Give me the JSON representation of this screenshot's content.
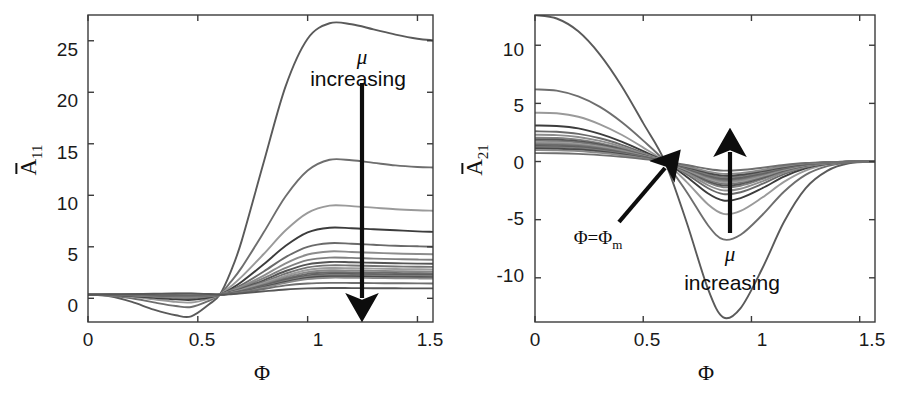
{
  "figure": {
    "background": "#ffffff",
    "axis_color": "#3b3b3b",
    "text_color": "#1a1a1a",
    "arrow_color": "#0d0d0d"
  },
  "panels": [
    {
      "id": "left",
      "ylabel_main": "A",
      "ylabel_sub": "11",
      "xlabel": "Φ",
      "xticks": [
        "0",
        "0.5",
        "1",
        "1.5"
      ],
      "yticks": [
        "0",
        "5",
        "10",
        "15",
        "20",
        "25"
      ],
      "annotations": {
        "mu": "μ",
        "increasing": "increasing"
      }
    },
    {
      "id": "right",
      "ylabel_main": "A",
      "ylabel_sub": "21",
      "xlabel": "Φ",
      "xticks": [
        "0",
        "0.5",
        "1",
        "1.5"
      ],
      "yticks": [
        "-10",
        "-5",
        "0",
        "5",
        "10"
      ],
      "annotations": {
        "mu": "μ",
        "increasing": "increasing",
        "phi_m_main": "Φ=Φ",
        "phi_m_sub": "m"
      }
    }
  ],
  "chart_data": [
    {
      "type": "line",
      "panel": "left",
      "title": "",
      "xlabel": "Φ",
      "ylabel": "Ā11 (A-bar 11)",
      "xlim": [
        0,
        1.5708
      ],
      "ylim": [
        -2.3,
        27.5
      ],
      "grid": false,
      "legend": "none",
      "x": [
        0,
        0.1,
        0.2,
        0.3,
        0.4,
        0.47,
        0.55,
        0.6,
        0.65,
        0.7,
        0.8,
        0.9,
        1.0,
        1.1,
        1.2,
        1.3,
        1.4,
        1.5,
        1.5708
      ],
      "crossing_point": {
        "x": 0.6,
        "y": 0.35
      },
      "series": [
        {
          "name": "mu-1 (smallest, darkest)",
          "gray": "#5a5a5a",
          "values": [
            0.35,
            0.2,
            -0.35,
            -1.1,
            -1.65,
            -1.75,
            -0.6,
            0.35,
            2.6,
            5.6,
            13.2,
            20.6,
            25.2,
            26.7,
            26.6,
            26.1,
            25.6,
            25.2,
            25.05
          ]
        },
        {
          "name": "mu-2",
          "gray": "#6e6e6e",
          "values": [
            0.35,
            0.25,
            0.0,
            -0.4,
            -0.75,
            -0.85,
            -0.25,
            0.35,
            1.6,
            3.0,
            6.4,
            9.9,
            12.4,
            13.45,
            13.4,
            13.15,
            12.9,
            12.75,
            12.7
          ]
        },
        {
          "name": "mu-3",
          "gray": "#9a9a9a",
          "values": [
            0.35,
            0.3,
            0.15,
            -0.1,
            -0.35,
            -0.4,
            -0.05,
            0.35,
            1.15,
            2.1,
            4.3,
            6.6,
            8.3,
            9.0,
            8.95,
            8.8,
            8.65,
            8.55,
            8.5
          ]
        },
        {
          "name": "mu-4",
          "gray": "#3c3c3c",
          "values": [
            0.35,
            0.32,
            0.22,
            0.05,
            -0.1,
            -0.15,
            0.08,
            0.35,
            0.9,
            1.6,
            3.3,
            5.1,
            6.4,
            6.85,
            6.8,
            6.7,
            6.6,
            6.5,
            6.45
          ]
        },
        {
          "name": "mu-5",
          "gray": "#6a6a6a",
          "values": [
            0.35,
            0.33,
            0.26,
            0.14,
            0.03,
            0.0,
            0.16,
            0.35,
            0.8,
            1.3,
            2.6,
            4.0,
            5.0,
            5.35,
            5.3,
            5.2,
            5.1,
            5.05,
            5.0
          ]
        },
        {
          "name": "mu-6",
          "gray": "#8d8d8d",
          "values": [
            0.35,
            0.34,
            0.29,
            0.2,
            0.11,
            0.09,
            0.21,
            0.35,
            0.72,
            1.15,
            2.2,
            3.4,
            4.25,
            4.55,
            4.5,
            4.42,
            4.35,
            4.3,
            4.28
          ]
        },
        {
          "name": "mu-7",
          "gray": "#808080",
          "values": [
            0.35,
            0.34,
            0.31,
            0.25,
            0.18,
            0.16,
            0.25,
            0.35,
            0.66,
            1.03,
            1.95,
            2.95,
            3.7,
            3.95,
            3.92,
            3.85,
            3.8,
            3.76,
            3.74
          ]
        },
        {
          "name": "mu-8",
          "gray": "#555555",
          "values": [
            0.35,
            0.35,
            0.32,
            0.28,
            0.23,
            0.22,
            0.28,
            0.35,
            0.62,
            0.94,
            1.75,
            2.65,
            3.3,
            3.53,
            3.5,
            3.45,
            3.4,
            3.37,
            3.35
          ]
        },
        {
          "name": "mu-9",
          "gray": "#747474",
          "values": [
            0.35,
            0.35,
            0.33,
            0.3,
            0.27,
            0.26,
            0.3,
            0.35,
            0.58,
            0.87,
            1.6,
            2.4,
            3.0,
            3.2,
            3.18,
            3.13,
            3.09,
            3.06,
            3.05
          ]
        },
        {
          "name": "mu-10",
          "gray": "#9c9c9c",
          "values": [
            0.35,
            0.35,
            0.34,
            0.32,
            0.3,
            0.29,
            0.32,
            0.35,
            0.55,
            0.81,
            1.48,
            2.2,
            2.75,
            2.94,
            2.92,
            2.88,
            2.84,
            2.82,
            2.8
          ]
        },
        {
          "name": "mu-11",
          "gray": "#888888",
          "values": [
            0.35,
            0.35,
            0.34,
            0.33,
            0.32,
            0.31,
            0.33,
            0.35,
            0.53,
            0.76,
            1.37,
            2.04,
            2.54,
            2.72,
            2.7,
            2.66,
            2.63,
            2.6,
            2.59
          ]
        },
        {
          "name": "mu-12",
          "gray": "#6b6b6b",
          "values": [
            0.35,
            0.35,
            0.35,
            0.34,
            0.33,
            0.33,
            0.34,
            0.35,
            0.51,
            0.72,
            1.28,
            1.9,
            2.37,
            2.53,
            2.51,
            2.48,
            2.45,
            2.43,
            2.42
          ]
        },
        {
          "name": "mu-13",
          "gray": "#5f5f5f",
          "values": [
            0.35,
            0.35,
            0.35,
            0.35,
            0.35,
            0.35,
            0.35,
            0.35,
            0.49,
            0.68,
            1.2,
            1.78,
            2.22,
            2.37,
            2.36,
            2.33,
            2.3,
            2.28,
            2.27
          ]
        },
        {
          "name": "mu-14",
          "gray": "#7c7c7c",
          "values": [
            0.35,
            0.35,
            0.35,
            0.36,
            0.36,
            0.36,
            0.36,
            0.35,
            0.48,
            0.65,
            1.14,
            1.68,
            2.09,
            2.24,
            2.23,
            2.2,
            2.17,
            2.15,
            2.14
          ]
        },
        {
          "name": "mu-15",
          "gray": "#4a4a4a",
          "values": [
            0.35,
            0.36,
            0.36,
            0.37,
            0.37,
            0.37,
            0.36,
            0.35,
            0.46,
            0.62,
            1.08,
            1.59,
            1.98,
            2.12,
            2.11,
            2.08,
            2.06,
            2.04,
            2.03
          ]
        },
        {
          "name": "mu-16",
          "gray": "#8a8a8a",
          "values": [
            0.35,
            0.36,
            0.37,
            0.38,
            0.39,
            0.39,
            0.37,
            0.35,
            0.45,
            0.59,
            1.02,
            1.5,
            1.87,
            2.0,
            1.99,
            1.97,
            1.95,
            1.93,
            1.92
          ]
        },
        {
          "name": "mu-17 (largest, light)",
          "gray": "#6f6f6f",
          "values": [
            0.35,
            0.37,
            0.39,
            0.42,
            0.44,
            0.45,
            0.4,
            0.35,
            0.42,
            0.54,
            0.9,
            1.25,
            1.44,
            1.5,
            1.49,
            1.47,
            1.46,
            1.45,
            1.44
          ]
        },
        {
          "name": "mu-18 (bottom band)",
          "gray": "#575757",
          "values": [
            0.35,
            0.37,
            0.4,
            0.44,
            0.47,
            0.48,
            0.42,
            0.35,
            0.4,
            0.48,
            0.68,
            0.86,
            0.96,
            1.0,
            0.99,
            0.98,
            0.97,
            0.96,
            0.96
          ]
        }
      ],
      "arrow": {
        "label": "μ increasing",
        "from": {
          "x": 1.245,
          "y": 22.8
        },
        "to": {
          "x": 1.245,
          "y": 1.1
        }
      }
    },
    {
      "type": "line",
      "panel": "right",
      "title": "",
      "xlabel": "Φ",
      "ylabel": "Ā21 (A-bar 21)",
      "xlim": [
        0,
        1.5708
      ],
      "ylim": [
        -13.8,
        12.6
      ],
      "grid": false,
      "legend": "none",
      "x": [
        0,
        0.1,
        0.2,
        0.3,
        0.4,
        0.5,
        0.6,
        0.7,
        0.8,
        0.87,
        0.95,
        1.05,
        1.15,
        1.25,
        1.35,
        1.45,
        1.5708
      ],
      "crossing_point": {
        "x": 0.6,
        "y": 0.0
      },
      "series": [
        {
          "name": "mu-1 (smallest, darkest)",
          "gray": "#5a5a5a",
          "values": [
            12.6,
            12.3,
            11.2,
            9.2,
            6.5,
            3.3,
            0.0,
            -5.2,
            -11.0,
            -13.4,
            -12.6,
            -9.2,
            -5.2,
            -2.3,
            -0.8,
            -0.15,
            0.0
          ]
        },
        {
          "name": "mu-2",
          "gray": "#6e6e6e",
          "values": [
            6.2,
            6.1,
            5.6,
            4.7,
            3.4,
            1.8,
            0.0,
            -2.6,
            -5.5,
            -6.7,
            -6.3,
            -4.6,
            -2.6,
            -1.15,
            -0.4,
            -0.08,
            0.0
          ]
        },
        {
          "name": "mu-3",
          "gray": "#9a9a9a",
          "values": [
            4.2,
            4.15,
            3.85,
            3.2,
            2.3,
            1.2,
            0.0,
            -1.75,
            -3.7,
            -4.5,
            -4.25,
            -3.1,
            -1.75,
            -0.78,
            -0.27,
            -0.05,
            0.0
          ]
        },
        {
          "name": "mu-4",
          "gray": "#3c3c3c",
          "values": [
            3.1,
            3.05,
            2.85,
            2.38,
            1.72,
            0.9,
            0.0,
            -1.3,
            -2.75,
            -3.35,
            -3.15,
            -2.3,
            -1.3,
            -0.58,
            -0.2,
            -0.04,
            0.0
          ]
        },
        {
          "name": "mu-5",
          "gray": "#6a6a6a",
          "values": [
            2.6,
            2.56,
            2.38,
            2.0,
            1.44,
            0.75,
            0.0,
            -1.08,
            -2.3,
            -2.8,
            -2.64,
            -1.93,
            -1.08,
            -0.48,
            -0.17,
            -0.03,
            0.0
          ]
        },
        {
          "name": "mu-6",
          "gray": "#8d8d8d",
          "values": [
            2.3,
            2.27,
            2.11,
            1.77,
            1.28,
            0.66,
            0.0,
            -0.96,
            -2.04,
            -2.48,
            -2.34,
            -1.71,
            -0.96,
            -0.43,
            -0.15,
            -0.03,
            0.0
          ]
        },
        {
          "name": "mu-7",
          "gray": "#808080",
          "values": [
            2.05,
            2.02,
            1.88,
            1.58,
            1.14,
            0.59,
            0.0,
            -0.86,
            -1.82,
            -2.21,
            -2.08,
            -1.52,
            -0.86,
            -0.38,
            -0.13,
            -0.02,
            0.0
          ]
        },
        {
          "name": "mu-8",
          "gray": "#555555",
          "values": [
            1.9,
            1.87,
            1.74,
            1.46,
            1.05,
            0.55,
            0.0,
            -0.79,
            -1.68,
            -2.05,
            -1.93,
            -1.41,
            -0.79,
            -0.35,
            -0.12,
            -0.02,
            0.0
          ]
        },
        {
          "name": "mu-9",
          "gray": "#747474",
          "values": [
            1.78,
            1.75,
            1.63,
            1.37,
            0.99,
            0.51,
            0.0,
            -0.74,
            -1.58,
            -1.92,
            -1.81,
            -1.32,
            -0.74,
            -0.33,
            -0.11,
            -0.02,
            0.0
          ]
        },
        {
          "name": "mu-10",
          "gray": "#9c9c9c",
          "values": [
            1.66,
            1.64,
            1.52,
            1.28,
            0.92,
            0.48,
            0.0,
            -0.69,
            -1.47,
            -1.79,
            -1.69,
            -1.23,
            -0.69,
            -0.31,
            -0.11,
            -0.02,
            0.0
          ]
        },
        {
          "name": "mu-11",
          "gray": "#888888",
          "values": [
            1.55,
            1.53,
            1.42,
            1.19,
            0.86,
            0.45,
            0.0,
            -0.65,
            -1.37,
            -1.67,
            -1.57,
            -1.15,
            -0.65,
            -0.29,
            -0.1,
            -0.02,
            0.0
          ]
        },
        {
          "name": "mu-12",
          "gray": "#6b6b6b",
          "values": [
            1.45,
            1.43,
            1.33,
            1.12,
            0.81,
            0.42,
            0.0,
            -0.6,
            -1.28,
            -1.56,
            -1.47,
            -1.07,
            -0.6,
            -0.27,
            -0.09,
            -0.02,
            0.0
          ]
        },
        {
          "name": "mu-13",
          "gray": "#5f5f5f",
          "values": [
            1.34,
            1.32,
            1.23,
            1.03,
            0.74,
            0.39,
            0.0,
            -0.56,
            -1.19,
            -1.45,
            -1.37,
            -1.0,
            -0.56,
            -0.25,
            -0.09,
            -0.02,
            0.0
          ]
        },
        {
          "name": "mu-14",
          "gray": "#7c7c7c",
          "values": [
            1.24,
            1.22,
            1.14,
            0.95,
            0.69,
            0.36,
            0.0,
            -0.52,
            -1.1,
            -1.34,
            -1.26,
            -0.92,
            -0.52,
            -0.23,
            -0.08,
            -0.01,
            0.0
          ]
        },
        {
          "name": "mu-15",
          "gray": "#4a4a4a",
          "values": [
            1.12,
            1.1,
            1.03,
            0.86,
            0.62,
            0.32,
            0.0,
            -0.47,
            -0.99,
            -1.21,
            -1.14,
            -0.83,
            -0.47,
            -0.21,
            -0.07,
            -0.01,
            0.0
          ]
        },
        {
          "name": "mu-16",
          "gray": "#8a8a8a",
          "values": [
            0.98,
            0.96,
            0.9,
            0.75,
            0.54,
            0.28,
            0.0,
            -0.41,
            -0.87,
            -1.06,
            -1.0,
            -0.73,
            -0.41,
            -0.18,
            -0.06,
            -0.01,
            0.0
          ]
        },
        {
          "name": "mu-17 (largest)",
          "gray": "#6f6f6f",
          "values": [
            0.72,
            0.71,
            0.66,
            0.55,
            0.4,
            0.21,
            0.0,
            -0.3,
            -0.64,
            -0.78,
            -0.73,
            -0.53,
            -0.3,
            -0.13,
            -0.05,
            -0.01,
            0.0
          ]
        }
      ],
      "arrows": [
        {
          "label": "μ increasing",
          "from": {
            "x": 0.9,
            "y": -6.3
          },
          "to": {
            "x": 0.9,
            "y": 0.9
          }
        },
        {
          "label": "Φ=Φm",
          "from": {
            "x": 0.39,
            "y": -4.9
          },
          "to": {
            "x": 0.602,
            "y": 0.35
          }
        }
      ]
    }
  ]
}
